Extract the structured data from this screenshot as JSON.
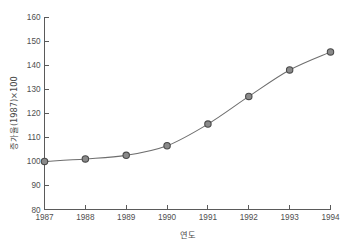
{
  "chart_data": {
    "type": "line",
    "title": "",
    "subtitle": "",
    "xlabel": "연도",
    "ylabel": "증가율(1987)×100",
    "categories": [
      "1987",
      "1988",
      "1989",
      "1990",
      "1991",
      "1992",
      "1993",
      "1994"
    ],
    "x": [
      1987,
      1988,
      1989,
      1990,
      1991,
      1992,
      1993,
      1994
    ],
    "values": [
      100,
      101,
      102.5,
      106.5,
      115.5,
      127,
      138,
      145.5
    ],
    "series": [
      {
        "name": "증가율",
        "values": [
          100,
          101,
          102.5,
          106.5,
          115.5,
          127,
          138,
          145.5
        ]
      }
    ],
    "xlim": [
      1987,
      1994
    ],
    "ylim": [
      80,
      160
    ],
    "ytick_labels": [
      "80",
      "90",
      "100",
      "110",
      "120",
      "130",
      "140",
      "150",
      "160"
    ],
    "ytick_values": [
      80,
      90,
      100,
      110,
      120,
      130,
      140,
      150,
      160
    ],
    "xtick_labels": [
      "1987",
      "1988",
      "1989",
      "1990",
      "1991",
      "1992",
      "1993",
      "1994"
    ],
    "grid": false,
    "legend": "none",
    "marker": "circle",
    "line_color": "#6e6e6e",
    "marker_fill_color": "#8a8a8a",
    "marker_edge_color": "#4a4a4a",
    "axis_color": "#5a5a5a",
    "background_color": "#ffffff",
    "text_color": "#4a4a4a"
  }
}
